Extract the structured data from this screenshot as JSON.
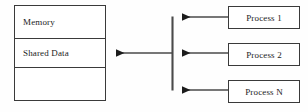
{
  "diagram": {
    "background_color": "#fefefe",
    "stroke_color": "#3a3a3a",
    "text_color": "#1c1c1c",
    "memory": {
      "rows": [
        {
          "label": "Memory",
          "name": "memory-row"
        },
        {
          "label": "Shared Data",
          "name": "shared-data-row"
        },
        {
          "label": "",
          "name": "empty-row"
        }
      ]
    },
    "processes": [
      {
        "label": "Process 1",
        "name": "process-1"
      },
      {
        "label": "Process 2",
        "name": "process-2"
      },
      {
        "label": "Process N",
        "name": "process-n"
      }
    ],
    "connectors": [
      {
        "name": "process-1-to-bus",
        "from": "Process 1",
        "to": "shared-memory-bus",
        "direction": "left"
      },
      {
        "name": "process-2-to-shared-data",
        "from": "Process 2",
        "to": "Shared Data",
        "direction": "left"
      },
      {
        "name": "process-n-to-bus",
        "from": "Process N",
        "to": "shared-memory-bus",
        "direction": "left"
      },
      {
        "name": "bus-trunk",
        "from": "Process 1 row",
        "to": "Process N row",
        "direction": "vertical"
      }
    ]
  }
}
